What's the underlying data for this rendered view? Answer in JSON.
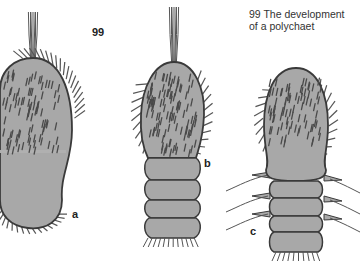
{
  "figure": {
    "number": "99",
    "caption_line1": "99 The development",
    "caption_line2": "of a polychaet",
    "stages": [
      {
        "label": "a",
        "description": "early larva, rounded ciliated body"
      },
      {
        "label": "b",
        "description": "larva with developing segments"
      },
      {
        "label": "c",
        "description": "segmented juvenile with parapodia"
      }
    ]
  },
  "colors": {
    "body_fill": "#a8a8a8",
    "body_dark": "#8f8f8f",
    "outline": "#3a3a3a",
    "bristle": "#555555",
    "background": "#ffffff"
  }
}
